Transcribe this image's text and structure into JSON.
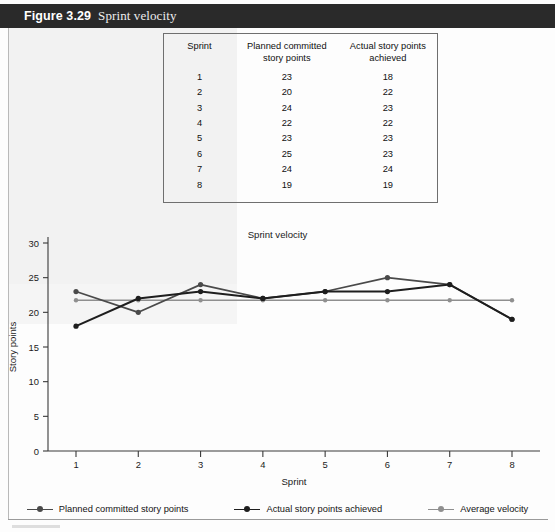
{
  "figure": {
    "number": "Figure 3.29",
    "caption": "Sprint velocity"
  },
  "table": {
    "headers": [
      "Sprint",
      "Planned committed story points",
      "Actual story points achieved"
    ],
    "header_lines": [
      [
        "Sprint"
      ],
      [
        "Planned committed",
        "story points"
      ],
      [
        "Actual story points",
        "achieved"
      ]
    ],
    "rows": [
      [
        "1",
        "23",
        "18"
      ],
      [
        "2",
        "20",
        "22"
      ],
      [
        "3",
        "24",
        "23"
      ],
      [
        "4",
        "22",
        "22"
      ],
      [
        "5",
        "23",
        "23"
      ],
      [
        "6",
        "25",
        "23"
      ],
      [
        "7",
        "24",
        "24"
      ],
      [
        "8",
        "19",
        "19"
      ]
    ]
  },
  "chart_data": {
    "type": "line",
    "title": "Sprint velocity",
    "xlabel": "Sprint",
    "ylabel": "Story points",
    "x": [
      1,
      2,
      3,
      4,
      5,
      6,
      7,
      8
    ],
    "xticklabels": [
      "1",
      "2",
      "3",
      "4",
      "5",
      "6",
      "7",
      "8"
    ],
    "yticks": [
      0,
      5,
      10,
      15,
      20,
      25,
      30
    ],
    "yticklabels": [
      "0",
      "5",
      "10",
      "15",
      "20",
      "25",
      "30"
    ],
    "ylim": [
      0,
      30
    ],
    "xlim": [
      1,
      8
    ],
    "grid": false,
    "legend_position": "bottom",
    "series": [
      {
        "name": "Planned committed story points",
        "values": [
          23,
          20,
          24,
          22,
          23,
          25,
          24,
          19
        ],
        "color": "#4a4a4a",
        "marker": "circle"
      },
      {
        "name": "Actual story points achieved",
        "values": [
          18,
          22,
          23,
          22,
          23,
          23,
          24,
          19
        ],
        "color": "#1e1e1e",
        "marker": "circle"
      },
      {
        "name": "Average velocity",
        "values": [
          21.75,
          21.75,
          21.75,
          21.75,
          21.75,
          21.75,
          21.75,
          21.75
        ],
        "color": "#8f8f8f",
        "marker": "circle"
      }
    ]
  },
  "legend": {
    "items": [
      {
        "label": "Planned committed story points",
        "color": "#4a4a4a"
      },
      {
        "label": "Actual story points achieved",
        "color": "#1e1e1e"
      },
      {
        "label": "Average velocity",
        "color": "#8f8f8f"
      }
    ]
  }
}
